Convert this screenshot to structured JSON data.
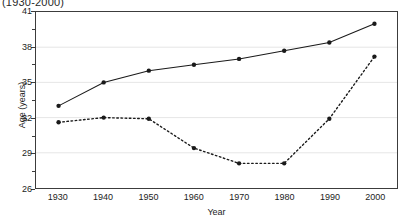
{
  "title_fragment": "(1930-2000)",
  "chart_data": {
    "type": "line",
    "title": "(1930-2000)",
    "xlabel": "Year",
    "ylabel": "Age (years)",
    "x": [
      1930,
      1940,
      1950,
      1960,
      1970,
      1980,
      1990,
      2000
    ],
    "xtick_labels": [
      "1930",
      "1940",
      "1950",
      "1960",
      "1970",
      "1980",
      "1990",
      "2000"
    ],
    "ytick_labels": [
      "26",
      "29",
      "32",
      "35",
      "38",
      "41"
    ],
    "ytick_values": [
      26,
      29,
      32,
      35,
      38,
      41
    ],
    "xlim": [
      1925,
      2005
    ],
    "ylim": [
      26,
      41
    ],
    "grid": true,
    "legend": "none",
    "series": [
      {
        "name": "solid-series",
        "style": "solid",
        "marker": "filled-circle",
        "color": "#1a1a1a",
        "values": [
          33.0,
          35.0,
          36.0,
          36.5,
          37.0,
          37.7,
          38.4,
          40.0
        ]
      },
      {
        "name": "dashed-series",
        "style": "dotted",
        "marker": "filled-circle",
        "color": "#1a1a1a",
        "values": [
          31.6,
          32.0,
          31.9,
          29.4,
          28.1,
          28.1,
          31.9,
          37.2
        ]
      }
    ]
  },
  "axis_color": "#3c3c3c",
  "grid_color": "#e6e6e6"
}
